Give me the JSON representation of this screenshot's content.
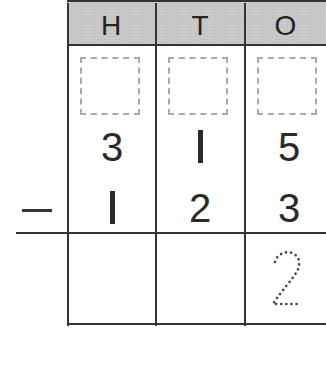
{
  "header": {
    "columns": [
      "H",
      "T",
      "O"
    ]
  },
  "place_value_boxes": [
    "",
    "",
    ""
  ],
  "minuend": [
    "3",
    "l",
    "5"
  ],
  "operator": "−",
  "subtrahend": [
    "l",
    "2",
    "3"
  ],
  "answer": [
    "",
    "",
    "2"
  ],
  "colors": {
    "header_bg": "#c9c9c9",
    "lines": "#333333",
    "dotted_box": "#a9a9a9",
    "trace_digit": "#444444"
  }
}
